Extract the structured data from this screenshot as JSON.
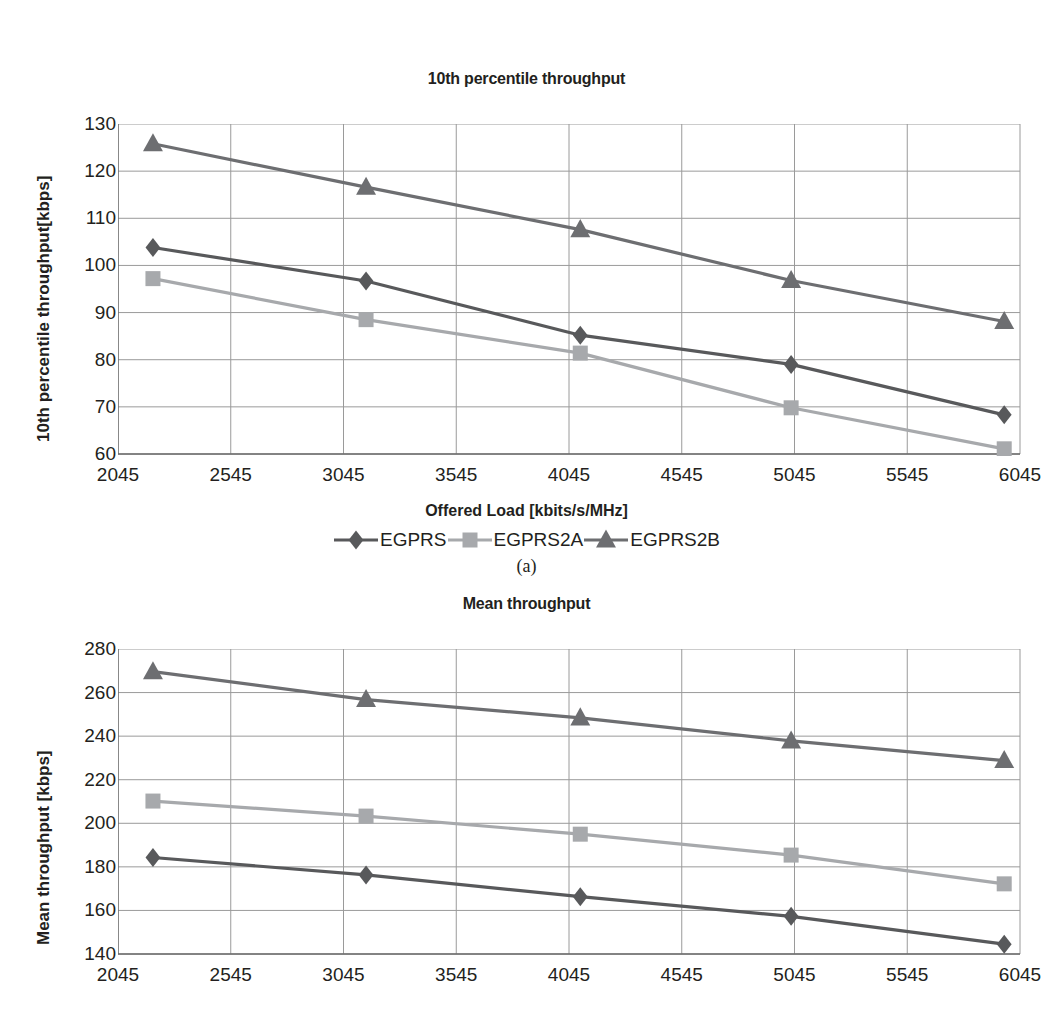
{
  "figure": {
    "caption_a": "(a)"
  },
  "legend": {
    "position": "below-chart-a",
    "items": [
      {
        "label": "EGPRS",
        "marker": "diamond-marker",
        "color": "#58595b"
      },
      {
        "label": "EGPRS2A",
        "marker": "square-marker",
        "color": "#a7a9ac"
      },
      {
        "label": "EGPRS2B",
        "marker": "triangle-marker",
        "color": "#6d6e71"
      }
    ]
  },
  "chart_data": [
    {
      "id": "chart-a",
      "type": "line",
      "title": "10th percentile throughput",
      "xlabel": "Offered Load [kbits/s/MHz]",
      "ylabel": "10th percentile throughput[kbps]",
      "x": [
        2200,
        3145,
        4095,
        5030,
        5975
      ],
      "xlim": [
        2045,
        6045
      ],
      "ylim": [
        60,
        130
      ],
      "xticks": [
        2045,
        2545,
        3045,
        3545,
        4045,
        4545,
        5045,
        5545,
        6045
      ],
      "yticks": [
        60,
        70,
        80,
        90,
        100,
        110,
        120,
        130
      ],
      "grid": true,
      "legend_position": "bottom",
      "series": [
        {
          "name": "EGPRS",
          "marker": "diamond",
          "color": "#58595b",
          "values": [
            103.8,
            96.7,
            85.2,
            79.0,
            68.3
          ]
        },
        {
          "name": "EGPRS2A",
          "marker": "square",
          "color": "#a7a9ac",
          "values": [
            97.2,
            88.5,
            81.4,
            69.8,
            61.1
          ]
        },
        {
          "name": "EGPRS2B",
          "marker": "triangle",
          "color": "#6d6e71",
          "values": [
            125.8,
            116.6,
            107.6,
            96.8,
            88.1
          ]
        }
      ]
    },
    {
      "id": "chart-b",
      "type": "line",
      "title": "Mean throughput",
      "xlabel": "",
      "ylabel": "Mean throughput [kbps]",
      "x": [
        2200,
        3145,
        4095,
        5030,
        5975
      ],
      "xlim": [
        2045,
        6045
      ],
      "ylim": [
        140,
        280
      ],
      "xticks": [
        2045,
        2545,
        3045,
        3545,
        4045,
        4545,
        5045,
        5545,
        6045
      ],
      "yticks": [
        140,
        160,
        180,
        200,
        220,
        240,
        260,
        280
      ],
      "grid": true,
      "legend_position": "none",
      "series": [
        {
          "name": "EGPRS",
          "marker": "diamond",
          "color": "#58595b",
          "values": [
            184.3,
            176.3,
            166.3,
            157.3,
            144.5
          ]
        },
        {
          "name": "EGPRS2A",
          "marker": "square",
          "color": "#a7a9ac",
          "values": [
            210.2,
            203.3,
            195.0,
            185.4,
            172.2
          ]
        },
        {
          "name": "EGPRS2B",
          "marker": "triangle",
          "color": "#6d6e71",
          "values": [
            269.6,
            256.8,
            248.4,
            237.8,
            228.8
          ]
        }
      ]
    }
  ]
}
